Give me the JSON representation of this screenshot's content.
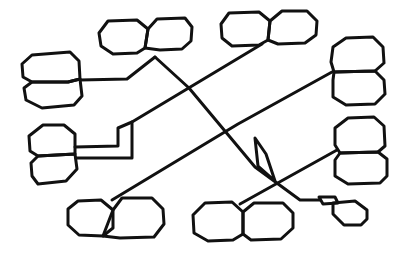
{
  "diagram": {
    "width": 409,
    "height": 257,
    "stroke_color": "#111111",
    "background": "#ffffff",
    "octagon_pairs": [
      {
        "id": "top-center-left",
        "shapes": [
          "108,21 137,20 148,29 145,48 137,53 113,54 101,46 99,33",
          "148,29 157,19 185,18 192,27 191,41 182,49 160,50 145,48"
        ]
      },
      {
        "id": "top-right",
        "shapes": [
          "229,13 259,12 270,21 268,40 259,45 232,46 222,38 221,24",
          "270,21 282,11 307,11 317,21 316,35 305,43 278,44 268,40"
        ]
      },
      {
        "id": "left-upper",
        "shapes": [
          "32,55 70,52 79,61 80,79 68,82 32,82 23,77 22,64",
          "32,82 68,82 80,79 82,96 74,105 42,108 26,100 24,88"
        ]
      },
      {
        "id": "right-upper",
        "shapes": [
          "346,38 373,37 383,47 384,63 375,71 334,72 331,62 333,47",
          "334,72 375,71 384,80 385,94 375,104 346,105 333,97 333,80"
        ]
      },
      {
        "id": "left-middle",
        "shapes": [
          "43,125 64,125 75,134 75,154 38,156 30,151 29,136",
          "38,156 75,154 77,169 66,181 38,184 32,176 31,163"
        ]
      },
      {
        "id": "right-middle",
        "shapes": [
          "348,118 374,117 384,126 385,146 378,152 340,153 335,145 335,128",
          "340,153 378,152 387,159 387,176 380,183 348,184 335,176 335,160"
        ]
      },
      {
        "id": "bottom-left",
        "shapes": [
          "78,201 101,200 113,210 113,228 103,236 79,235 68,225 68,209",
          "113,210 122,198 152,198 163,209 164,224 154,237 120,238 103,236"
        ]
      },
      {
        "id": "bottom-center",
        "shapes": [
          "205,203 232,202 243,212 243,234 233,240 208,241 194,233 193,215",
          "243,212 254,203 283,203 293,213 293,228 281,239 251,240 243,234"
        ]
      },
      {
        "id": "bottom-right-small",
        "shapes": [
          "319,197 335,197 338,203 323,204",
          "333,203 355,201 367,210 367,219 361,225 344,225 333,214"
        ]
      }
    ],
    "connectors": [
      {
        "id": "left-upper-to-top-center",
        "points": "80,80 127,79 155,57"
      },
      {
        "id": "top-center-long-diagonal",
        "points": "155,57 189,88 255,167 300,200 320,200"
      },
      {
        "id": "top-right-to-left-middle",
        "points": "262,44 132,122 132,158 76,158"
      },
      {
        "id": "left-middle-upper-step",
        "points": "75,147 118,146 118,128 132,122"
      },
      {
        "id": "right-upper-to-bottom-left",
        "points": "332,72 238,124 112,200"
      },
      {
        "id": "diamond",
        "points": "255,138 266,154 275,181 258,166"
      },
      {
        "id": "right-middle-to-bottom-center",
        "points": "337,150 240,204"
      }
    ]
  }
}
